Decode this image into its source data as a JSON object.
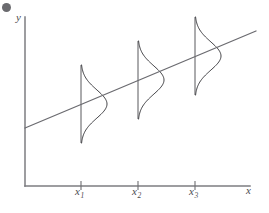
{
  "figure": {
    "kind": "scatter-regression-normal-distributions",
    "background_color": "#ffffff",
    "axis_color": "#7c7c80",
    "line_color": "#6b6b70",
    "curve_color": "#3a3a3e",
    "label_color": "#4a4a4e",
    "corner_mark_name": "page-corner-dot"
  },
  "axes": {
    "y_label": "y",
    "x_label": "x",
    "origin": {
      "x": 25,
      "y": 186
    },
    "x_axis_end": {
      "x": 250,
      "y": 186
    },
    "y_axis_top": {
      "x": 25,
      "y": 17
    }
  },
  "ticks": [
    {
      "id": "x1",
      "base": "x",
      "subscript": "1",
      "x": 81,
      "label_left": 75
    },
    {
      "id": "x2",
      "base": "x",
      "subscript": "2",
      "x": 138,
      "label_left": 132
    },
    {
      "id": "x3",
      "base": "x",
      "subscript": "3",
      "x": 195,
      "label_left": 189
    }
  ],
  "chart_data": {
    "type": "line",
    "title": "",
    "xlabel": "x",
    "ylabel": "y",
    "grid": false,
    "legend": null,
    "xlim": [
      25,
      250
    ],
    "ylim": [
      186,
      17
    ],
    "series": [
      {
        "name": "regression-line",
        "type": "line",
        "points": [
          [
            25,
            128
          ],
          [
            256,
            31
          ]
        ],
        "slope_px_per_px": -0.42,
        "color": "#6b6b70"
      },
      {
        "name": "normal-distributions",
        "type": "curve-set",
        "orientation": "horizontal-bell-opening-right",
        "color": "#3a3a3e",
        "distributions": [
          {
            "at": "x1",
            "center_x": 81,
            "center_y": 104,
            "half_height": 39,
            "peak_width": 26
          },
          {
            "at": "x2",
            "center_x": 138,
            "center_y": 80,
            "half_height": 39,
            "peak_width": 26
          },
          {
            "at": "x3",
            "center_x": 195,
            "center_y": 56,
            "half_height": 39,
            "peak_width": 26
          }
        ]
      }
    ]
  }
}
